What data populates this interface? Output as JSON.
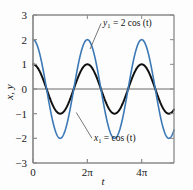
{
  "chart_data": {
    "type": "line",
    "title": "",
    "xlabel": "t",
    "ylabel": "x, y",
    "xlim": [
      0,
      16.3
    ],
    "ylim": [
      -3,
      3
    ],
    "grid": false,
    "legend_position": "inline-annotations",
    "x_ticks": [
      {
        "value": 0,
        "label": "0"
      },
      {
        "value": 6.2832,
        "label": "2π"
      },
      {
        "value": 12.5664,
        "label": "4π"
      }
    ],
    "y_ticks": [
      {
        "value": 3,
        "label": "3"
      },
      {
        "value": 2,
        "label": "2"
      },
      {
        "value": 1,
        "label": "1"
      },
      {
        "value": 0,
        "label": "0"
      },
      {
        "value": -1,
        "label": "−1"
      },
      {
        "value": -2,
        "label": "−2"
      },
      {
        "value": -3,
        "label": "−3"
      }
    ],
    "zero_line": {
      "value": 0,
      "color": "#9a9a9a"
    },
    "series": [
      {
        "name": "x1",
        "label_text": "x₁ = cos (t)",
        "expression": "cos(t)",
        "amplitude": 1,
        "period": 6.2832,
        "color": "#101010",
        "line_width": 2.0,
        "annotation": {
          "text_x": 7.05,
          "text_y": -2.12,
          "leader_to_x": 5.0,
          "leader_to_y": -0.95
        }
      },
      {
        "name": "y1",
        "label_text": "y₁ = 2 cos (t)",
        "expression": "2*cos(t)",
        "amplitude": 2,
        "period": 6.2832,
        "color": "#3b78b5",
        "line_width": 1.6,
        "annotation": {
          "text_x": 8.1,
          "text_y": 2.54,
          "leader_to_x": 6.6,
          "leader_to_y": 1.62
        }
      }
    ],
    "frame_color": "#8a8a8a",
    "background": "#fdfdfd"
  },
  "labels": {
    "y_axis_title": "x, y",
    "x_axis_title": "t",
    "series_one_label": "x₁ = cos (t)",
    "series_two_label": "y₁ = 2 cos (t)"
  }
}
